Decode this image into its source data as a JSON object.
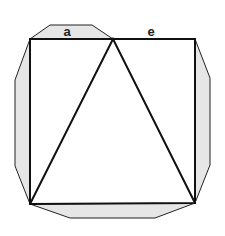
{
  "diagram": {
    "labels": {
      "top_left_segment": "a",
      "top_right_segment": "e"
    },
    "colors": {
      "stroke": "#111111",
      "shade": "#e6e6e6",
      "background": "#ffffff"
    },
    "square": {
      "top_left": [
        30,
        39
      ],
      "top_right": [
        195,
        39
      ],
      "bottom_right": [
        195,
        203
      ],
      "bottom_left": [
        30,
        204
      ]
    },
    "triangle": {
      "apex": [
        113,
        39
      ],
      "base_left": [
        30,
        204
      ],
      "base_right": [
        195,
        203
      ]
    }
  }
}
